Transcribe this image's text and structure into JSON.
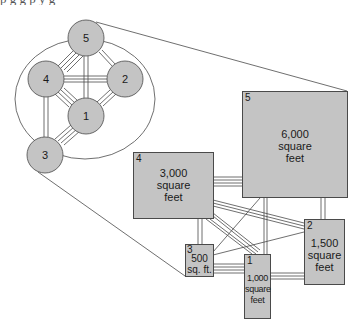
{
  "top_crop_text": "p        g        g                                   p                          y  g",
  "bubble_diagram": {
    "nodes": [
      {
        "id": "5",
        "label": "5"
      },
      {
        "id": "4",
        "label": "4"
      },
      {
        "id": "2",
        "label": "2"
      },
      {
        "id": "1",
        "label": "1"
      },
      {
        "id": "3",
        "label": "3"
      }
    ]
  },
  "block_diagram": {
    "spaces": [
      {
        "id": "5",
        "number": "5",
        "area_lines": [
          "6,000",
          "square",
          "feet"
        ]
      },
      {
        "id": "4",
        "number": "4",
        "area_lines": [
          "3,000",
          "square",
          "feet"
        ]
      },
      {
        "id": "2",
        "number": "2",
        "area_lines": [
          "1,500",
          "square",
          "feet"
        ]
      },
      {
        "id": "3",
        "number": "3",
        "area_lines": [
          "500",
          "sq. ft."
        ]
      },
      {
        "id": "1",
        "number": "1",
        "area_lines": [
          "1,000",
          "square",
          "feet"
        ]
      }
    ]
  },
  "colors": {
    "fill": "#c4c4c4",
    "stroke": "#4a4a4a",
    "background": "#ffffff"
  }
}
